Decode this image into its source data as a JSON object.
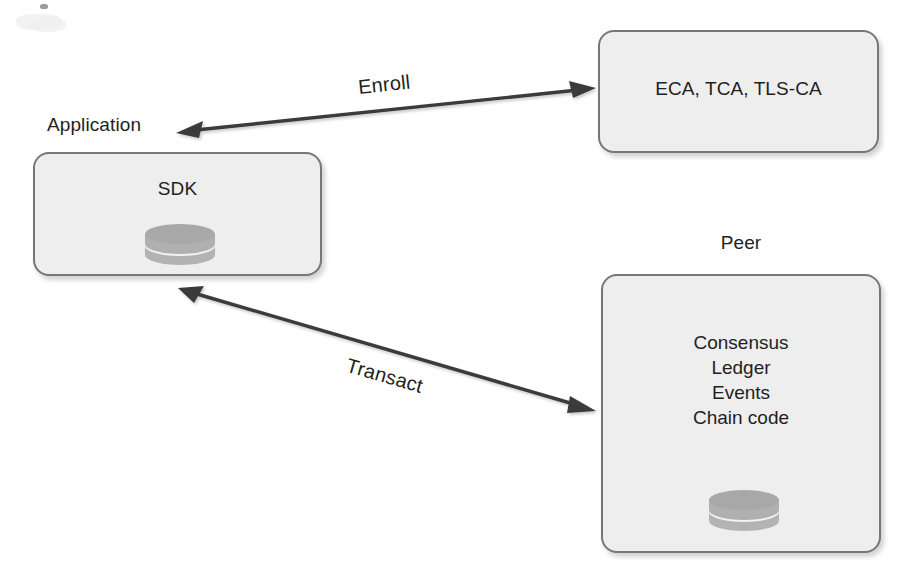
{
  "diagram": {
    "background_color": "#ffffff",
    "node_fill_color": "#eeeeee",
    "node_border_color": "#777777",
    "text_color": "#231f20",
    "arrow_color": "#3a3a3a"
  },
  "nodes": {
    "application": {
      "caption": "Application",
      "title": "SDK",
      "icon": "database-disk-icon"
    },
    "ca": {
      "title": "ECA, TCA, TLS-CA"
    },
    "peer": {
      "caption": "Peer",
      "items": [
        "Consensus",
        "Ledger",
        "Events",
        "Chain code"
      ],
      "icon": "database-disk-icon"
    }
  },
  "edges": [
    {
      "label": "Enroll",
      "from": "application",
      "to": "ca",
      "arrowheads": "both"
    },
    {
      "label": "Transact",
      "from": "application",
      "to": "peer",
      "arrowheads": "both"
    }
  ]
}
